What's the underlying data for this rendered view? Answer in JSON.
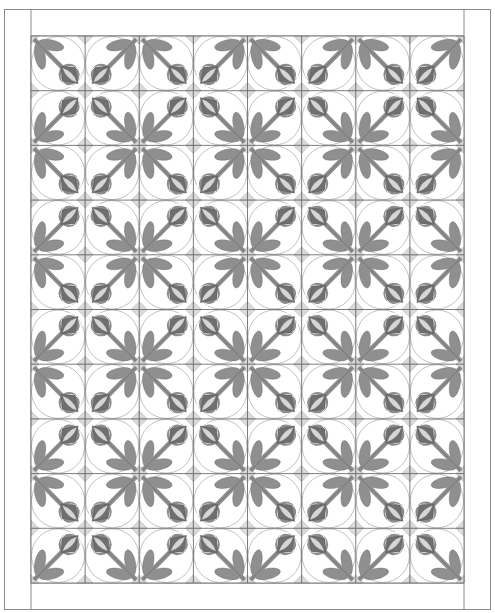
{
  "quilt": {
    "title": "Rose bud block quilt layout",
    "rows": 10,
    "cols": 8,
    "repeat": [
      [
        "tl",
        "tr"
      ],
      [
        "bl",
        "br"
      ]
    ],
    "colors": {
      "background": "#ffffff",
      "border_line": "#8a8a8a",
      "grid_line": "#6e6e6e",
      "leaf": "#8f8f8f",
      "stem": "#8f8f8f",
      "bud_circle": "#8c8c8c",
      "bud_petal": "#6f6f6f",
      "bud_center": "#d6d6d6",
      "corner_patch": "#dadada",
      "outline": "#555555",
      "ring": "#9a9a9a"
    }
  }
}
